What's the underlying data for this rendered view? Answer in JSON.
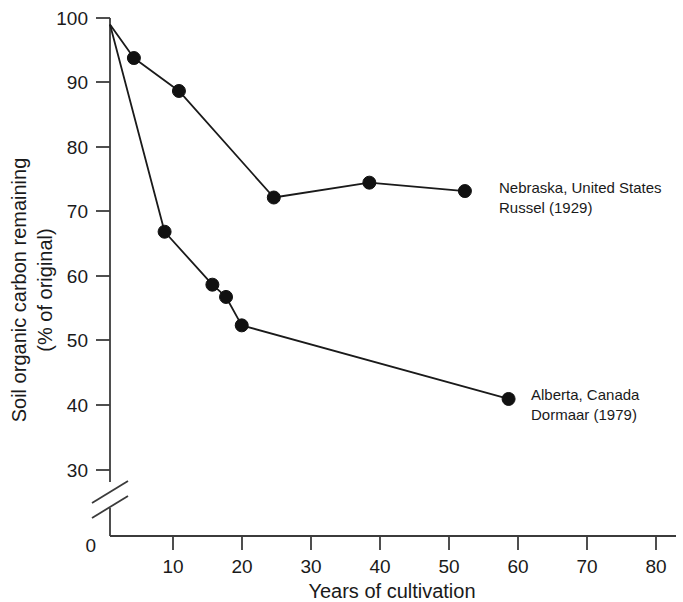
{
  "chart_data": {
    "type": "line",
    "title": "",
    "xlabel": "Years of cultivation",
    "ylabel": "Soil organic carbon remaining\n(% of original)",
    "ylabel_line1": "Soil organic carbon remaining",
    "ylabel_line2": "(% of original)",
    "xlim": [
      0,
      85
    ],
    "ylim": [
      30,
      100
    ],
    "y_axis_break": true,
    "y_break_note": "axis broken between 30 and 0",
    "grid": false,
    "legend_position": "inline-annotation-right",
    "xticks": [
      0,
      10,
      20,
      30,
      40,
      50,
      60,
      70,
      80
    ],
    "xtick_labels": [
      "0",
      "10",
      "20",
      "30",
      "40",
      "50",
      "60",
      "70",
      "80"
    ],
    "yticks": [
      0,
      30,
      40,
      50,
      60,
      70,
      80,
      90,
      100
    ],
    "ytick_labels": [
      "0",
      "30",
      "40",
      "50",
      "60",
      "70",
      "80",
      "90",
      "100"
    ],
    "series": [
      {
        "name": "Nebraska, United States",
        "citation": "Russel (1929)",
        "label_line1": "Nebraska, United States",
        "label_line2": "Russel (1929)",
        "color": "#111111",
        "marker": "filled-circle",
        "x": [
          0,
          3.5,
          10.1,
          24,
          38,
          52
        ],
        "y": [
          99,
          93.8,
          88.7,
          72.2,
          74.5,
          73.2
        ]
      },
      {
        "name": "Alberta, Canada",
        "citation": "Dormaar (1979)",
        "label_line1": "Alberta, Canada",
        "label_line2": "Dormaar (1979)",
        "color": "#111111",
        "marker": "filled-circle",
        "x": [
          0,
          8,
          15,
          17,
          19.3,
          58.4
        ],
        "y": [
          99,
          66.9,
          58.7,
          56.8,
          52.4,
          41
        ]
      }
    ]
  },
  "axes": {
    "x_title": "Years of cultivation",
    "y_title_line1": "Soil organic carbon remaining",
    "y_title_line2": "(% of original)"
  },
  "annotations": {
    "nebraska": {
      "line1": "Nebraska, United States",
      "line2": "Russel (1929)"
    },
    "alberta": {
      "line1": "Alberta, Canada",
      "line2": "Dormaar (1979)"
    }
  },
  "ticks": {
    "y": [
      "100",
      "90",
      "80",
      "70",
      "60",
      "50",
      "40",
      "30",
      "0"
    ],
    "x": [
      "0",
      "10",
      "20",
      "30",
      "40",
      "50",
      "60",
      "70",
      "80"
    ]
  },
  "colors": {
    "axis": "#3b3b3b",
    "series": "#111111",
    "background": "#ffffff",
    "text": "#1a1a1a"
  }
}
